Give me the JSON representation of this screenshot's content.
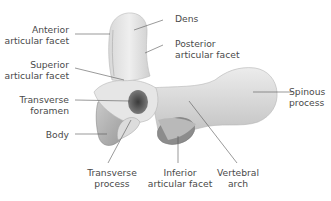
{
  "figure": {
    "colors": {
      "bone_light": "#eeeeee",
      "bone_mid": "#cfcfcf",
      "bone_dark": "#8a8a8a",
      "leader_line": "#555555",
      "label_text": "#4a4a4a"
    }
  },
  "labels": {
    "dens": [
      "Dens"
    ],
    "anterior_articular_facet": [
      "Anterior",
      "articular facet"
    ],
    "posterior_articular_facet": [
      "Posterior",
      "articular facet"
    ],
    "superior_articular_facet": [
      "Superior",
      "articular facet"
    ],
    "transverse_foramen": [
      "Transverse",
      "foramen"
    ],
    "body": [
      "Body"
    ],
    "spinous_process": [
      "Spinous",
      "process"
    ],
    "transverse_process": [
      "Transverse",
      "process"
    ],
    "inferior_articular_facet": [
      "Inferior",
      "articular facet"
    ],
    "vertebral_arch": [
      "Vertebral",
      "arch"
    ]
  }
}
